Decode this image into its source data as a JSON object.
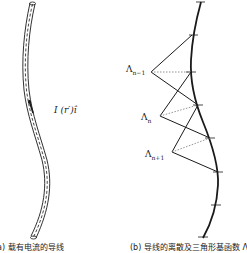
{
  "figure": {
    "panel_a": {
      "caption": "(a) 载有电流的导线",
      "current_label": "I (r′)î"
    },
    "panel_b": {
      "caption": "(b) 导线的离散及三角形基函数 Λ",
      "basis_labels": [
        {
          "base": "Λ",
          "sub": "n−1"
        },
        {
          "base": "Λ",
          "sub": "n"
        },
        {
          "base": "Λ",
          "sub": "n+1"
        }
      ]
    },
    "colors": {
      "stroke": "#1a1a1a",
      "dotted": "#777777",
      "background": "#ffffff"
    }
  }
}
